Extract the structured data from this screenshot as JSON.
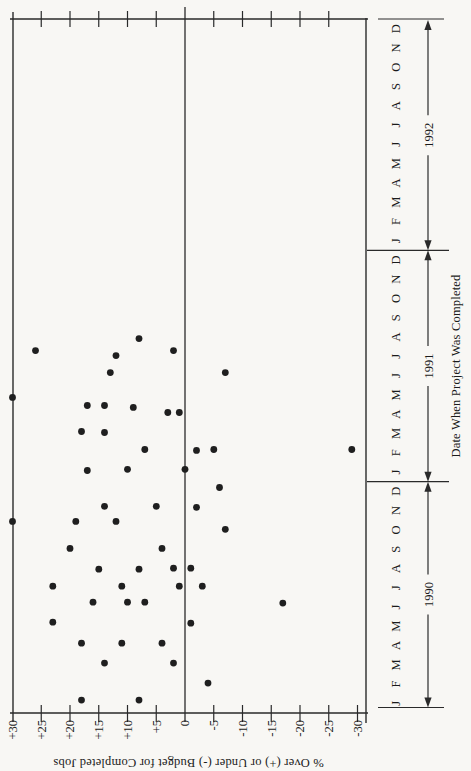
{
  "chart_data": {
    "type": "scatter",
    "title": "",
    "xlabel": "Date When Project Was Completed",
    "ylabel": "% Over (+) or Under (-) Budget for Completed Jobs",
    "page_rotation_deg": -90,
    "grid": false,
    "zero_line": true,
    "x_axis": {
      "month_letters": [
        "J",
        "F",
        "M",
        "A",
        "M",
        "J",
        "J",
        "A",
        "S",
        "O",
        "N",
        "D"
      ],
      "years": [
        "1990",
        "1991",
        "1992"
      ],
      "range_months": 36
    },
    "y_axis": {
      "min": -30,
      "max": 30,
      "tick_step": 5,
      "tick_labels": [
        "+30",
        "+25",
        "+20",
        "+15",
        "+10",
        "+5",
        "0",
        "-5",
        "-10",
        "-15",
        "-20",
        "-25",
        "-30"
      ]
    },
    "points_format": [
      "year",
      "month",
      "fraction_of_month",
      "percent_over_under"
    ],
    "points": [
      [
        1990,
        1,
        0.67,
        18
      ],
      [
        1990,
        1,
        0.67,
        8
      ],
      [
        1990,
        2,
        0.55,
        -4
      ],
      [
        1990,
        3,
        0.59,
        14
      ],
      [
        1990,
        3,
        0.59,
        2
      ],
      [
        1990,
        4,
        0.62,
        18
      ],
      [
        1990,
        4,
        0.62,
        11
      ],
      [
        1990,
        4,
        0.62,
        4
      ],
      [
        1990,
        5,
        0.71,
        23
      ],
      [
        1990,
        5,
        0.66,
        -1
      ],
      [
        1990,
        6,
        0.75,
        16
      ],
      [
        1990,
        6,
        0.75,
        10
      ],
      [
        1990,
        6,
        0.75,
        7
      ],
      [
        1990,
        6,
        0.7,
        -17
      ],
      [
        1990,
        7,
        0.58,
        23
      ],
      [
        1990,
        7,
        0.58,
        11
      ],
      [
        1990,
        7,
        0.58,
        1
      ],
      [
        1990,
        7,
        0.58,
        -3
      ],
      [
        1990,
        8,
        0.46,
        15
      ],
      [
        1990,
        8,
        0.46,
        8
      ],
      [
        1990,
        8,
        0.51,
        2
      ],
      [
        1990,
        8,
        0.51,
        -1
      ],
      [
        1990,
        9,
        0.54,
        20
      ],
      [
        1990,
        9,
        0.54,
        4
      ],
      [
        1990,
        10,
        0.94,
        30
      ],
      [
        1990,
        10,
        0.94,
        19
      ],
      [
        1990,
        10,
        0.94,
        12
      ],
      [
        1990,
        10,
        0.53,
        -7
      ],
      [
        1990,
        11,
        0.72,
        14
      ],
      [
        1990,
        11,
        0.72,
        5
      ],
      [
        1990,
        11,
        0.67,
        -2
      ],
      [
        1990,
        12,
        0.7,
        -6
      ],
      [
        1991,
        1,
        0.58,
        17
      ],
      [
        1991,
        1,
        0.64,
        10
      ],
      [
        1991,
        1,
        0.64,
        0
      ],
      [
        1991,
        2,
        0.67,
        7
      ],
      [
        1991,
        2,
        0.62,
        -2
      ],
      [
        1991,
        2,
        0.67,
        -5
      ],
      [
        1991,
        2,
        0.67,
        -29
      ],
      [
        1991,
        3,
        0.6,
        18
      ],
      [
        1991,
        3,
        0.55,
        14
      ],
      [
        1991,
        4,
        0.95,
        17
      ],
      [
        1991,
        4,
        0.95,
        14
      ],
      [
        1991,
        4,
        0.85,
        9
      ],
      [
        1991,
        4,
        0.59,
        3
      ],
      [
        1991,
        4,
        0.59,
        1
      ],
      [
        1991,
        5,
        0.37,
        30
      ],
      [
        1991,
        6,
        0.66,
        13
      ],
      [
        1991,
        6,
        0.66,
        -7
      ],
      [
        1991,
        7,
        0.8,
        26
      ],
      [
        1991,
        7,
        0.54,
        12
      ],
      [
        1991,
        7,
        0.8,
        2
      ],
      [
        1991,
        8,
        0.42,
        8
      ]
    ]
  },
  "colors": {
    "background": "#f8f7f4",
    "ink": "#2a2a2a",
    "text": "#1b1b1b",
    "dot": "#1f1f1f"
  }
}
